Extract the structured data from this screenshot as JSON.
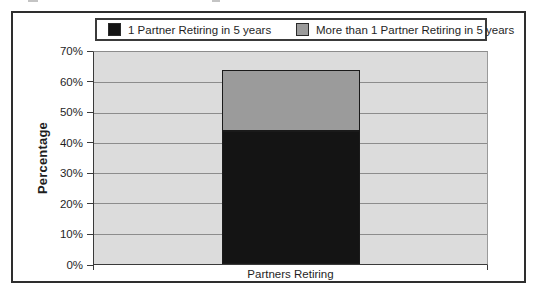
{
  "figure": {
    "background": "#ffffff",
    "frame_border_color": "#2e2e2e"
  },
  "chart_data": {
    "type": "bar",
    "stacked": true,
    "categories": [
      "Partners Retiring"
    ],
    "series": [
      {
        "name": "1 Partner Retiring in 5 years",
        "values": [
          44
        ],
        "color": "#141414"
      },
      {
        "name": "More than 1 Partner Retiring in 5 years",
        "values": [
          20
        ],
        "color": "#9b9b9b"
      }
    ],
    "title": "",
    "xlabel": "",
    "ylabel": "Percentage",
    "ylim": [
      0,
      70
    ],
    "yticks": [
      "0%",
      "10%",
      "20%",
      "30%",
      "40%",
      "50%",
      "60%",
      "70%"
    ],
    "grid": true,
    "legend_position": "top",
    "plot_background": "#dcdcdc",
    "gridline_color": "#8c8c8c"
  }
}
